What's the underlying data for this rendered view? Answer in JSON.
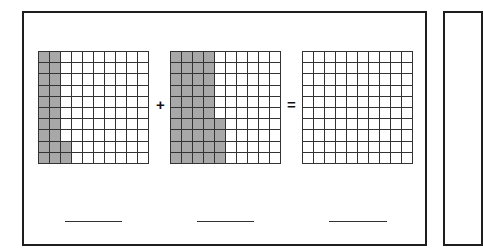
{
  "worksheet": {
    "title": "",
    "colors": {
      "shaded": "#a8a8a8",
      "gridline": "#333333",
      "border": "#1e1e1e",
      "background": "#ffffff"
    },
    "grids": [
      {
        "id": "grid-1",
        "rows": 10,
        "cols": 10,
        "shaded_full_columns": 2,
        "shaded_partial_column_cells": 2,
        "shaded_total": 22,
        "left": 38
      },
      {
        "id": "grid-2",
        "rows": 10,
        "cols": 10,
        "shaded_full_columns": 4,
        "shaded_partial_column_cells": 4,
        "shaded_total": 44,
        "left": 170
      },
      {
        "id": "grid-3",
        "rows": 10,
        "cols": 10,
        "shaded_full_columns": 0,
        "shaded_partial_column_cells": 0,
        "shaded_total": 0,
        "left": 302
      }
    ],
    "operators": {
      "plus": "+",
      "equals": "="
    },
    "answer_blanks": [
      {
        "value": "",
        "left": 65,
        "width": 57
      },
      {
        "value": "",
        "left": 197,
        "width": 57
      },
      {
        "value": "",
        "left": 329,
        "width": 58
      }
    ]
  },
  "chart_data": {
    "type": "table",
    "grids": [
      {
        "shaded": 22,
        "total": 100,
        "decimal": 0.22
      },
      {
        "shaded": 44,
        "total": 100,
        "decimal": 0.44
      },
      {
        "shaded": 0,
        "total": 100,
        "decimal": null
      }
    ],
    "operators": [
      "+",
      "="
    ]
  }
}
